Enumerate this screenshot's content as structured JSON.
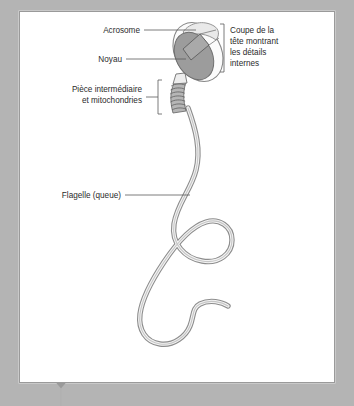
{
  "figure": {
    "kind": "biology-diagram",
    "background_color": "#b4b4b4",
    "panel_color": "#ffffff",
    "panel_border_color": "#9a9a9a",
    "ink_color": "#5a5a5a",
    "nucleus_fill": "#9c9c9c",
    "acrosome_fill": "#e8e8e8",
    "midpiece_fill": "#b0b0b0",
    "tail_fill": "#8d8d8d"
  },
  "labels": {
    "acrosome": "Acrosome",
    "noyau": "Noyau",
    "midpiece_line1": "Pièce intermédiaire",
    "midpiece_line2": "et mitochondries",
    "flagelle": "Flagelle (queue)",
    "coupe_line1": "Coupe de la",
    "coupe_line2": "tête montrant",
    "coupe_line3": "les détails",
    "coupe_line4": "internes"
  },
  "marker": {
    "name": "pointer-marker",
    "shape": "down-triangle-with-stem",
    "color": "#9a9a9a"
  }
}
